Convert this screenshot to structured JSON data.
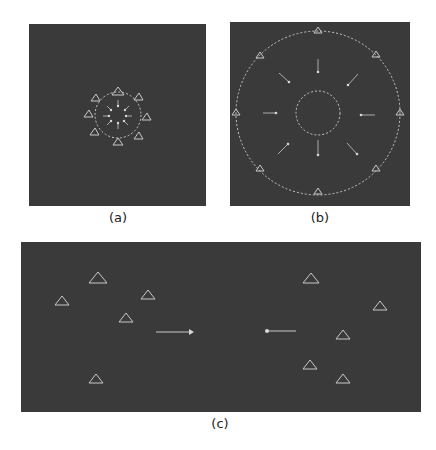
{
  "figure": {
    "panels": [
      {
        "id": "a",
        "caption": "(a)",
        "description": "Small dashed circle with triangles on its rim and inward short arrows (contracting)"
      },
      {
        "id": "b",
        "caption": "(b)",
        "description": "Large dashed circle with triangles on rim, inner dashed circle, radial arrows pointing outward (expanding)"
      },
      {
        "id": "c",
        "caption": "(c)",
        "description": "Two groups of scattered triangles; left group with arrow pointing right, right group with arrow pointing left"
      }
    ],
    "colors": {
      "background": "#3a3a3a",
      "marker": "#c8c8c8",
      "page": "#ffffff"
    }
  }
}
